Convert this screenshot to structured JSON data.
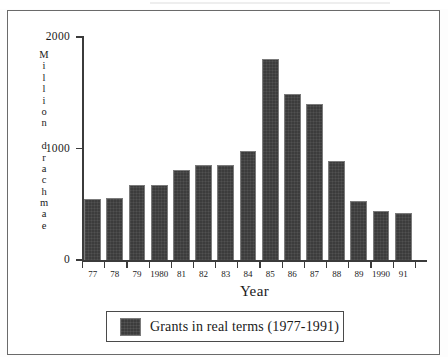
{
  "chart_data": {
    "type": "bar",
    "title": "",
    "xlabel": "Year",
    "ylabel": "Million drachmae",
    "categories": [
      "77",
      "78",
      "79",
      "1980",
      "81",
      "82",
      "83",
      "84",
      "85",
      "86",
      "87",
      "88",
      "89",
      "1990",
      "91"
    ],
    "values": [
      545,
      555,
      670,
      670,
      805,
      850,
      855,
      975,
      1805,
      1485,
      1395,
      890,
      525,
      440,
      425
    ],
    "series": [
      {
        "name": "Grants in real terms (1977-1991)",
        "values": [
          545,
          555,
          670,
          670,
          805,
          850,
          855,
          975,
          1805,
          1485,
          1395,
          890,
          525,
          440,
          425
        ]
      }
    ],
    "ylim": [
      0,
      2000
    ],
    "ytick_labels": [
      "0",
      "1000",
      "2000"
    ],
    "ytick_values": [
      0,
      1000,
      2000
    ],
    "grid": false,
    "legend_position": "bottom",
    "bar_color": "#3c3c3c",
    "bar_edge_color": "#7b7b7b",
    "axis_color": "#3b3b3b",
    "frame_color": "#6a6a6a"
  },
  "axes": {
    "y_title_chars": [
      "M",
      "i",
      "l",
      "l",
      "i",
      "o",
      "n",
      " ",
      "d",
      "r",
      "a",
      "c",
      "h",
      "m",
      "a",
      "e"
    ],
    "x_title": "Year"
  },
  "legend": {
    "entries": [
      {
        "label": "Grants in real terms (1977-1991)",
        "color": "#3c3c3c"
      }
    ]
  }
}
